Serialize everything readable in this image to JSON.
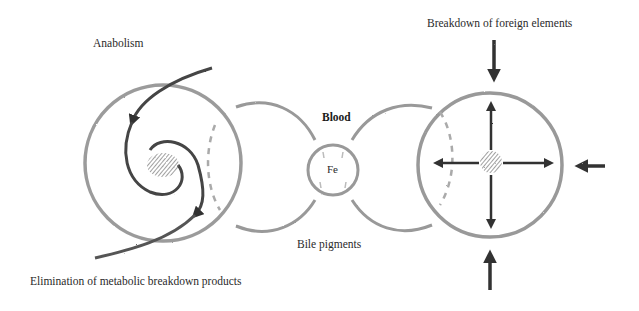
{
  "labels": {
    "anabolism": "Anabolism",
    "elimination": "Elimination of metabolic breakdown products",
    "blood": "Blood",
    "iron": "Fe",
    "bile": "Bile pigments",
    "foreign": "Breakdown of foreign elements"
  },
  "nodes": [
    {
      "id": "metabolic-cell",
      "shape": "circle",
      "contains": "spiral with inward and outward arrows"
    },
    {
      "id": "blood-iron-cell",
      "shape": "circle",
      "label": "Fe"
    },
    {
      "id": "defense-cell",
      "shape": "circle",
      "contains": "center with four outward arrows, three external inward arrows"
    }
  ],
  "colors": {
    "stroke": "#555555",
    "light_stroke": "#9a9a9a",
    "arrow": "#333333",
    "text": "#2a2a2a"
  }
}
